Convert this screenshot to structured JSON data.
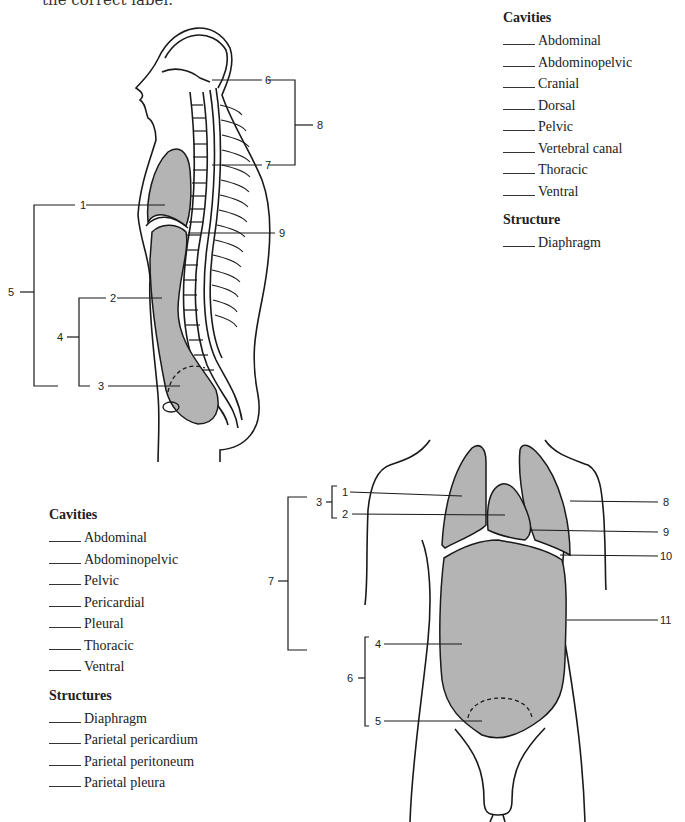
{
  "header_fragment": "the correct label.",
  "sagittal_figure": {
    "labels": [
      "1",
      "2",
      "3",
      "4",
      "5",
      "6",
      "7",
      "8",
      "9"
    ]
  },
  "sagittal_list": {
    "cavities_heading": "Cavities",
    "cavities": [
      "Abdominal",
      "Abdominopelvic",
      "Cranial",
      "Dorsal",
      "Pelvic",
      "Vertebral canal",
      "Thoracic",
      "Ventral"
    ],
    "structure_heading": "Structure",
    "structures": [
      "Diaphragm"
    ]
  },
  "frontal_figure": {
    "labels": [
      "1",
      "2",
      "3",
      "4",
      "5",
      "6",
      "7",
      "8",
      "9",
      "10",
      "11"
    ]
  },
  "frontal_list": {
    "cavities_heading": "Cavities",
    "cavities": [
      "Abdominal",
      "Abdominopelvic",
      "Pelvic",
      "Pericardial",
      "Pleural",
      "Thoracic",
      "Ventral"
    ],
    "structure_heading": "Structures",
    "structures": [
      "Diaphragm",
      "Parietal pericardium",
      "Parietal peritoneum",
      "Parietal pleura"
    ]
  },
  "colors": {
    "cavity_fill": "#b4b4b4",
    "line": "#1a1a1a"
  }
}
